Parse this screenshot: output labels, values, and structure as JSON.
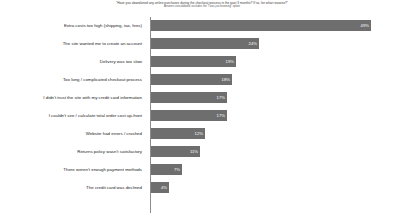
{
  "chart_data": {
    "type": "bar",
    "orientation": "horizontal",
    "title": "\"Have you abandoned any online purchases during the checkout process in the past 3 months? If so, for what reasons?\"",
    "subtitle": "Answers consolidated; excludes the \"I was just browsing\" option",
    "xlabel": "",
    "ylabel": "",
    "xlim": [
      0,
      55
    ],
    "grid": false,
    "legend": false,
    "bar_color": "#6e6e6e",
    "value_label_color": "#ffffff",
    "value_suffix": "%",
    "categories": [
      "Extra costs too high (shipping, tax, fees)",
      "The site wanted me to create an account",
      "Delivery was too slow",
      "Too long / complicated checkout process",
      "I didn't trust the site with my credit card information",
      "I couldn't see / calculate total order cost up-front",
      "Website had errors / crashed",
      "Returns policy wasn't satisfactory",
      "There weren't enough payment methods",
      "The credit card was declined"
    ],
    "values": [
      49,
      24,
      19,
      18,
      17,
      17,
      12,
      11,
      7,
      4
    ],
    "value_labels": [
      "49%",
      "24%",
      "19%",
      "18%",
      "17%",
      "17%",
      "12%",
      "11%",
      "7%",
      "4%"
    ]
  }
}
